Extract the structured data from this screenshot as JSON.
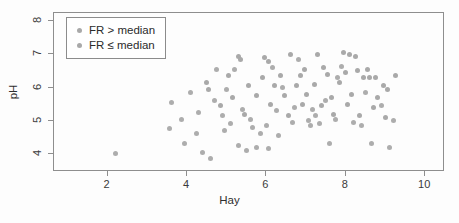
{
  "chart_data": {
    "type": "scatter",
    "title": "",
    "xlabel": "Hay",
    "ylabel": "pH",
    "xlim": [
      0.65,
      10.5
    ],
    "ylim": [
      3.45,
      8.25
    ],
    "xticks": [
      2,
      4,
      6,
      8,
      10
    ],
    "yticks": [
      4,
      5,
      6,
      7,
      8
    ],
    "grid": false,
    "legend": {
      "position": "top-left-inside",
      "entries": [
        {
          "label": "FR > median",
          "marker": "filled-circle",
          "color": "#a9a9a9"
        },
        {
          "label": "FR ≤ median",
          "marker": "filled-circle",
          "color": "#adadad"
        }
      ]
    },
    "marker_color": "#a9a9a9",
    "marker_size_px": 5,
    "series": [
      {
        "name": "FR > median",
        "color": "#a9a9a9",
        "points": [
          [
            4.5,
            6.15
          ],
          [
            5.3,
            6.95
          ],
          [
            5.35,
            6.85
          ],
          [
            5.95,
            6.9
          ],
          [
            6.05,
            6.8
          ],
          [
            6.6,
            7.0
          ],
          [
            7.3,
            7.0
          ],
          [
            7.95,
            7.05
          ],
          [
            8.1,
            7.0
          ],
          [
            8.25,
            6.95
          ],
          [
            6.95,
            6.55
          ],
          [
            7.45,
            6.6
          ],
          [
            8.3,
            6.5
          ],
          [
            8.55,
            6.55
          ],
          [
            9.25,
            6.35
          ],
          [
            5.05,
            6.35
          ],
          [
            5.9,
            6.3
          ],
          [
            6.35,
            6.35
          ],
          [
            6.85,
            6.35
          ],
          [
            7.55,
            6.4
          ],
          [
            8.0,
            6.45
          ],
          [
            8.45,
            6.3
          ],
          [
            8.6,
            6.3
          ],
          [
            8.75,
            6.3
          ],
          [
            4.55,
            5.95
          ],
          [
            5.55,
            6.05
          ],
          [
            6.2,
            6.05
          ],
          [
            6.75,
            6.05
          ],
          [
            7.2,
            6.1
          ],
          [
            7.85,
            6.15
          ],
          [
            8.95,
            6.05
          ],
          [
            9.05,
            5.95
          ],
          [
            5.15,
            5.7
          ],
          [
            5.75,
            5.75
          ],
          [
            6.45,
            5.75
          ],
          [
            7.0,
            5.8
          ],
          [
            7.65,
            5.7
          ],
          [
            8.15,
            5.8
          ],
          [
            8.8,
            5.7
          ],
          [
            4.85,
            5.45
          ],
          [
            6.1,
            5.5
          ],
          [
            6.9,
            5.5
          ],
          [
            7.4,
            5.45
          ],
          [
            8.05,
            5.5
          ],
          [
            8.7,
            5.4
          ],
          [
            5.45,
            5.2
          ],
          [
            6.55,
            5.15
          ],
          [
            7.7,
            5.2
          ],
          [
            8.35,
            5.15
          ],
          [
            9.0,
            5.1
          ]
        ]
      },
      {
        "name": "FR ≤ median",
        "color": "#adadad",
        "points": [
          [
            2.2,
            4.0
          ],
          [
            3.55,
            4.75
          ],
          [
            4.25,
            4.6
          ],
          [
            4.4,
            4.05
          ],
          [
            4.6,
            3.85
          ],
          [
            4.95,
            4.7
          ],
          [
            5.1,
            4.9
          ],
          [
            3.85,
            5.05
          ],
          [
            3.6,
            5.55
          ],
          [
            4.1,
            5.85
          ],
          [
            4.7,
            5.6
          ],
          [
            4.75,
            6.55
          ],
          [
            5.2,
            6.55
          ],
          [
            5.4,
            5.35
          ],
          [
            5.6,
            5.05
          ],
          [
            5.65,
            4.8
          ],
          [
            5.85,
            4.6
          ],
          [
            6.0,
            4.85
          ],
          [
            6.25,
            5.3
          ],
          [
            6.3,
            4.55
          ],
          [
            6.65,
            4.95
          ],
          [
            6.7,
            5.4
          ],
          [
            6.8,
            6.85
          ],
          [
            7.05,
            5.0
          ],
          [
            7.1,
            4.85
          ],
          [
            7.15,
            5.35
          ],
          [
            7.25,
            5.15
          ],
          [
            7.35,
            4.9
          ],
          [
            7.5,
            5.6
          ],
          [
            7.6,
            4.3
          ],
          [
            7.75,
            5.05
          ],
          [
            7.9,
            6.65
          ],
          [
            8.2,
            4.95
          ],
          [
            8.4,
            4.85
          ],
          [
            8.5,
            5.85
          ],
          [
            8.65,
            4.3
          ],
          [
            8.9,
            5.45
          ],
          [
            9.1,
            4.2
          ],
          [
            5.3,
            4.25
          ],
          [
            5.5,
            4.1
          ],
          [
            5.75,
            4.2
          ],
          [
            6.05,
            4.15
          ],
          [
            3.95,
            4.3
          ],
          [
            4.3,
            5.25
          ],
          [
            4.9,
            5.15
          ],
          [
            5.0,
            5.95
          ],
          [
            6.4,
            6.0
          ],
          [
            6.15,
            6.6
          ],
          [
            7.8,
            6.3
          ],
          [
            9.2,
            5.0
          ]
        ]
      }
    ]
  },
  "axis": {
    "xlabel": "Hay",
    "ylabel": "pH",
    "xticklabels": [
      "2",
      "4",
      "6",
      "8",
      "10"
    ],
    "yticklabels": [
      "4",
      "5",
      "6",
      "7",
      "8"
    ]
  }
}
